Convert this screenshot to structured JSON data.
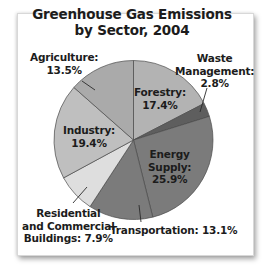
{
  "chart_data": {
    "type": "pie",
    "title": "Greenhouse Gas Emissions by Sector, 2004",
    "title_lines": [
      "Greenhouse Gas Emissions",
      "by Sector, 2004"
    ],
    "start_angle_deg": 0,
    "direction": "clockwise",
    "center": [
      133.5,
      140
    ],
    "radius": 79.5,
    "slices": [
      {
        "label": "Forestry",
        "value": 17.4,
        "display": "17.4%",
        "color": "#b3b3b3"
      },
      {
        "label": "Waste Management",
        "value": 2.8,
        "display": "2.8%",
        "color": "#5e5e5e"
      },
      {
        "label": "Energy Supply",
        "value": 25.9,
        "display": "25.9%",
        "color": "#7b7b7b"
      },
      {
        "label": "Transportation",
        "value": 13.1,
        "display": "13.1%",
        "color": "#7b7b7b"
      },
      {
        "label": "Residential and Commercial Buildings",
        "value": 7.9,
        "display": "7.9%",
        "color": "#dedede"
      },
      {
        "label": "Industry",
        "value": 19.4,
        "display": "19.4%",
        "color": "#bfbfbf"
      },
      {
        "label": "Agriculture",
        "value": 13.5,
        "display": "13.5%",
        "color": "#aaaaaa"
      }
    ],
    "legend": "none (labels placed on/around slices)"
  },
  "labels": {
    "forestry": {
      "line1": "Forestry:",
      "line2": "17.4%"
    },
    "waste": {
      "line1": "Waste",
      "line2": "Management:",
      "line3": "2.8%"
    },
    "energy": {
      "line1": "Energy",
      "line2": "Supply:",
      "line3": "25.9%"
    },
    "transportation": {
      "line1": "Transportation: 13.1%"
    },
    "residential": {
      "line1": "Residential",
      "line2": "and Commercial",
      "line3": "Buildings: 7.9%"
    },
    "industry": {
      "line1": "Industry:",
      "line2": "19.4%"
    },
    "agriculture": {
      "line1": "Agriculture:",
      "line2": "13.5%"
    }
  }
}
